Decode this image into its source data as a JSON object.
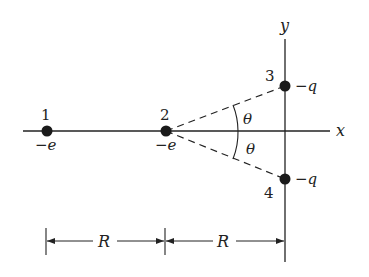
{
  "diagram": {
    "axes": {
      "x_label": "x",
      "y_label": "y"
    },
    "charges": [
      {
        "index": "1",
        "charge": "−e",
        "x": 47,
        "y": 131
      },
      {
        "index": "2",
        "charge": "−e",
        "x": 166,
        "y": 131
      },
      {
        "index": "3",
        "charge": "−q",
        "x": 285,
        "y": 86
      },
      {
        "index": "4",
        "charge": "−q",
        "x": 285,
        "y": 179
      }
    ],
    "angles": [
      {
        "label": "θ",
        "position": "upper"
      },
      {
        "label": "θ",
        "position": "lower"
      }
    ],
    "dimensions": [
      {
        "label": "R",
        "from": "charge 1",
        "to": "charge 2"
      },
      {
        "label": "R",
        "from": "charge 2",
        "to": "y-axis"
      }
    ],
    "colors": {
      "ink": "#222222",
      "background": "#ffffff"
    }
  }
}
